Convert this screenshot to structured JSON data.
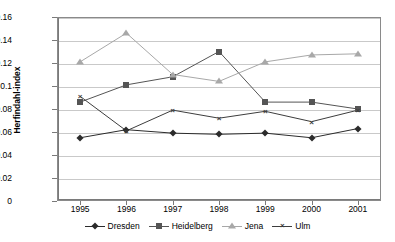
{
  "chart_data": {
    "type": "line",
    "title": "",
    "xlabel": "",
    "ylabel": "Herfindahl-index",
    "categories": [
      "1995",
      "1996",
      "1997",
      "1998",
      "1999",
      "2000",
      "2001"
    ],
    "ylim": [
      0,
      0.16
    ],
    "ytick_step": 0.02,
    "yticks": [
      "0",
      "0.02",
      "0.04",
      "0.06",
      "0.08",
      "0.1",
      "0.12",
      "0.14",
      "0.16"
    ],
    "ytick_values": [
      0,
      0.02,
      0.04,
      0.06,
      0.08,
      0.1,
      0.12,
      0.14,
      0.16
    ],
    "grid": "horizontal",
    "legend_position": "bottom",
    "series": [
      {
        "name": "Dresden",
        "marker": "diamond",
        "color": "#2b2b2b",
        "values": [
          0.055,
          0.062,
          0.059,
          0.058,
          0.059,
          0.055,
          0.063
        ]
      },
      {
        "name": "Heidelberg",
        "marker": "square",
        "color": "#555555",
        "values": [
          0.086,
          0.101,
          0.108,
          0.13,
          0.086,
          0.086,
          0.08
        ]
      },
      {
        "name": "Jena",
        "marker": "triangle",
        "color": "#a8a8a8",
        "values": [
          0.121,
          0.146,
          0.11,
          0.104,
          0.121,
          0.127,
          0.128
        ]
      },
      {
        "name": "Ulm",
        "marker": "cross",
        "color": "#3d3d3d",
        "values": [
          0.091,
          0.061,
          0.079,
          0.072,
          0.078,
          0.069,
          0.079
        ]
      }
    ]
  },
  "legend": {
    "items": [
      {
        "label": "Dresden",
        "glyph": "diamond-marker-icon"
      },
      {
        "label": "Heidelberg",
        "glyph": "square-marker-icon"
      },
      {
        "label": "Jena",
        "glyph": "triangle-marker-icon"
      },
      {
        "label": "Ulm",
        "glyph": "cross-marker-icon"
      }
    ]
  }
}
